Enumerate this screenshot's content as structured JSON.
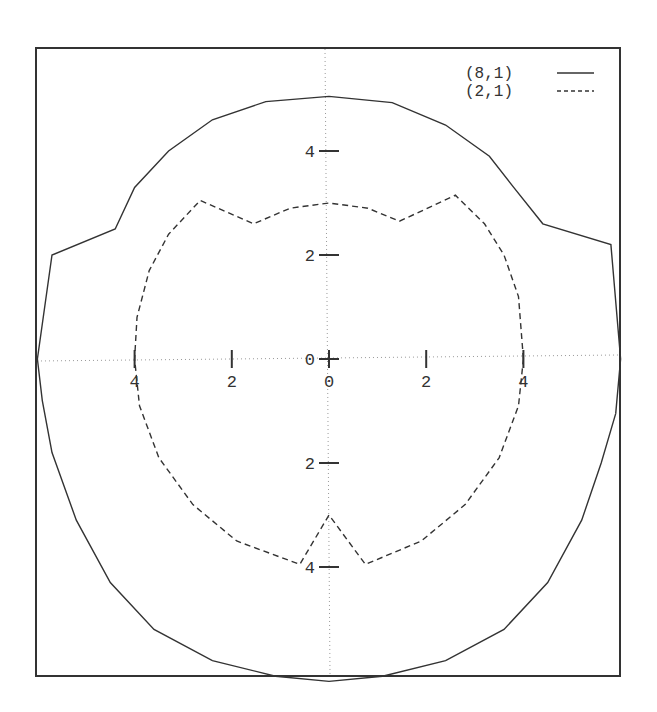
{
  "chart_data": {
    "type": "line",
    "title": "",
    "xlabel": "",
    "ylabel": "",
    "grid": false,
    "axes_style": "zero-axes dotted through origin",
    "legend_position": "top-right",
    "xlim": [
      -6,
      6
    ],
    "ylim": [
      -6,
      6.2
    ],
    "x_ticks": [
      {
        "value": -4,
        "label": "4"
      },
      {
        "value": -2,
        "label": "2"
      },
      {
        "value": 0,
        "label": "0"
      },
      {
        "value": 2,
        "label": "2"
      },
      {
        "value": 4,
        "label": "4"
      }
    ],
    "y_ticks": [
      {
        "value": 4,
        "label": "4"
      },
      {
        "value": 2,
        "label": "2"
      },
      {
        "value": 0,
        "label": "0"
      },
      {
        "value": -2,
        "label": "2"
      },
      {
        "value": -4,
        "label": "4"
      }
    ],
    "series": [
      {
        "name": "(8,1)",
        "style": "solid",
        "color": "#333333",
        "points": [
          [
            5.9,
            -1.05
          ],
          [
            6.0,
            0.0
          ],
          [
            5.8,
            2.2
          ],
          [
            4.4,
            2.6
          ],
          [
            3.8,
            3.3
          ],
          [
            3.3,
            3.9
          ],
          [
            2.4,
            4.5
          ],
          [
            1.3,
            4.93
          ],
          [
            0.0,
            5.05
          ],
          [
            -1.3,
            4.95
          ],
          [
            -2.4,
            4.6
          ],
          [
            -3.3,
            4.0
          ],
          [
            -4.0,
            3.3
          ],
          [
            -4.4,
            2.5
          ],
          [
            -5.7,
            2.0
          ],
          [
            -6.0,
            0.0
          ],
          [
            -5.9,
            -0.8
          ],
          [
            -5.7,
            -1.8
          ],
          [
            -5.2,
            -3.1
          ],
          [
            -4.5,
            -4.3
          ],
          [
            -3.6,
            -5.2
          ],
          [
            -2.4,
            -5.8
          ],
          [
            -1.1,
            -6.1
          ],
          [
            0.0,
            -6.2
          ],
          [
            1.1,
            -6.1
          ],
          [
            2.4,
            -5.8
          ],
          [
            3.6,
            -5.2
          ],
          [
            4.5,
            -4.3
          ],
          [
            5.2,
            -3.1
          ],
          [
            5.6,
            -2.0
          ],
          [
            5.9,
            -1.05
          ]
        ]
      },
      {
        "name": "(2,1)",
        "style": "dashed",
        "color": "#333333",
        "points": [
          [
            4.0,
            0.0
          ],
          [
            3.9,
            1.2
          ],
          [
            3.6,
            2.0
          ],
          [
            3.2,
            2.6
          ],
          [
            2.6,
            3.15
          ],
          [
            1.45,
            2.65
          ],
          [
            0.8,
            2.9
          ],
          [
            0.0,
            3.0
          ],
          [
            -0.8,
            2.9
          ],
          [
            -1.55,
            2.6
          ],
          [
            -2.65,
            3.05
          ],
          [
            -3.3,
            2.4
          ],
          [
            -3.7,
            1.7
          ],
          [
            -3.95,
            0.8
          ],
          [
            -4.0,
            0.0
          ],
          [
            -3.9,
            -0.9
          ],
          [
            -3.5,
            -1.9
          ],
          [
            -2.8,
            -2.8
          ],
          [
            -1.9,
            -3.5
          ],
          [
            -0.6,
            -3.95
          ],
          [
            0.0,
            -3.0
          ],
          [
            0.75,
            -3.95
          ],
          [
            1.9,
            -3.5
          ],
          [
            2.8,
            -2.8
          ],
          [
            3.5,
            -1.9
          ],
          [
            3.9,
            -0.9
          ],
          [
            4.0,
            0.0
          ]
        ]
      }
    ]
  },
  "legend": {
    "items": [
      {
        "label": "(8,1)",
        "style": "solid"
      },
      {
        "label": "(2,1)",
        "style": "dashed"
      }
    ]
  }
}
